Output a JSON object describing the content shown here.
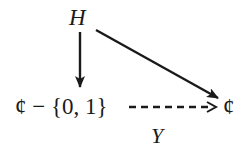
{
  "diagram": {
    "type": "commutative-diagram",
    "nodes": {
      "top": {
        "label": "H"
      },
      "bottom_left": {
        "label": "¢ − {0, 1}"
      },
      "bottom_right": {
        "label": "¢"
      }
    },
    "edges": [
      {
        "from": "top",
        "to": "bottom_left",
        "style": "solid",
        "label": ""
      },
      {
        "from": "top",
        "to": "bottom_right",
        "style": "solid",
        "label": ""
      },
      {
        "from": "bottom_left",
        "to": "bottom_right",
        "style": "dashed",
        "label": "Y"
      }
    ],
    "labels": {
      "dashed_edge": "Y"
    },
    "colors": {
      "ink": "#1a1a1a",
      "background": "#ffffff"
    }
  }
}
